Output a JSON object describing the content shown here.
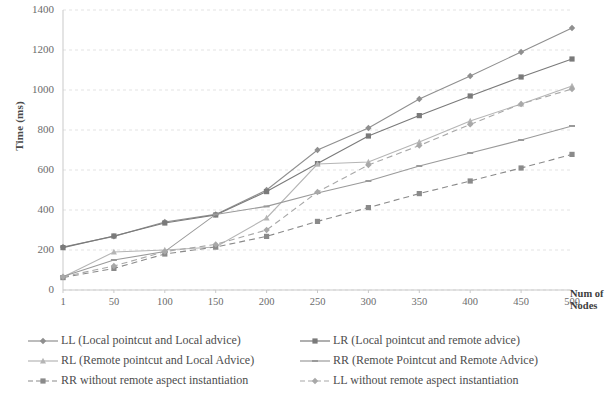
{
  "chart_data": {
    "type": "line",
    "title": "",
    "xlabel": "Num of Nodes",
    "ylabel": "Time (ms)",
    "x": [
      1,
      50,
      100,
      150,
      200,
      250,
      300,
      350,
      400,
      450,
      500
    ],
    "xtick_labels": [
      "1",
      "50",
      "100",
      "150",
      "200",
      "250",
      "300",
      "350",
      "400",
      "450",
      "500"
    ],
    "ytick_labels": [
      "0",
      "200",
      "400",
      "600",
      "800",
      "1000",
      "1200",
      "1400"
    ],
    "yticks": [
      0,
      200,
      400,
      600,
      800,
      1000,
      1200,
      1400
    ],
    "ylim": [
      0,
      1400
    ],
    "grid": true,
    "legend_position": "bottom",
    "series": [
      {
        "name": "LL (Local pointcut and Local advice)",
        "key": "LL",
        "color": "#8f8f8f",
        "dash": "solid",
        "marker": "diamond",
        "values": [
          215,
          268,
          340,
          378,
          500,
          700,
          810,
          955,
          1070,
          1190,
          1310
        ]
      },
      {
        "name": "LR (Local pointcut and remote advice)",
        "key": "LR",
        "color": "#7a7a7a",
        "dash": "solid",
        "marker": "square",
        "values": [
          212,
          270,
          335,
          375,
          492,
          632,
          770,
          872,
          970,
          1065,
          1155
        ]
      },
      {
        "name": "RL (Remote pointcut and Local Advice)",
        "key": "RL",
        "color": "#b5b5b5",
        "dash": "solid",
        "marker": "triangle",
        "values": [
          65,
          190,
          200,
          215,
          360,
          630,
          640,
          740,
          845,
          930,
          1020
        ]
      },
      {
        "name": "RR (Remote Pointcut and Remote Advice)",
        "key": "RR",
        "color": "#9a9a9a",
        "dash": "solid",
        "marker": "line",
        "values": [
          68,
          150,
          192,
          378,
          418,
          485,
          545,
          620,
          685,
          750,
          820
        ]
      },
      {
        "name": "RR without remote aspect instantiation",
        "key": "RR-noinst",
        "color": "#8a8a8a",
        "dash": "dashed",
        "marker": "square",
        "values": [
          62,
          108,
          180,
          215,
          268,
          343,
          412,
          482,
          545,
          610,
          678
        ]
      },
      {
        "name": "LL without remote aspect instantiation",
        "key": "LL-noinst",
        "color": "#a8a8a8",
        "dash": "dashed",
        "marker": "diamond",
        "values": [
          66,
          120,
          192,
          228,
          300,
          490,
          625,
          722,
          828,
          930,
          1005
        ]
      }
    ]
  },
  "axes": {
    "y_title": "Time (ms)",
    "x_title_line1": "Num of",
    "x_title_line2": "Nodes"
  },
  "legend": {
    "items": [
      {
        "label": "LL (Local pointcut and Local advice)",
        "series": 0
      },
      {
        "label": "LR (Local pointcut and remote advice)",
        "series": 1
      },
      {
        "label": "RL (Remote pointcut and Local Advice)",
        "series": 2
      },
      {
        "label": "RR (Remote Pointcut and Remote Advice)",
        "series": 3
      },
      {
        "label": "RR without remote aspect instantiation",
        "series": 4
      },
      {
        "label": "LL without remote aspect instantiation",
        "series": 5
      }
    ]
  }
}
